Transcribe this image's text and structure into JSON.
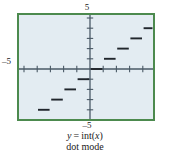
{
  "figure": {
    "caption_line1": "y = int(x)",
    "caption_line2": "dot mode",
    "caption_parts": {
      "var_y": "y",
      "equals": "=",
      "func": "int(",
      "var_x": "x",
      "close": ")"
    }
  },
  "axis_labels": {
    "top": "5",
    "bottom": "–5",
    "left": "–5"
  },
  "colors": {
    "frame": "#4c8a4e",
    "screen_bg": "#e3ecf2",
    "axis": "#4a5a66",
    "curve": "#20262c",
    "text": "#1b1b1b",
    "page_bg": "#ffffff"
  },
  "chart_data": {
    "type": "line",
    "subtitle": "dot mode",
    "xlabel": "",
    "ylabel": "",
    "xlim": [
      -5,
      5
    ],
    "ylim": [
      -5,
      5
    ],
    "xticks": [
      -5,
      -4,
      -3,
      -2,
      -1,
      0,
      1,
      2,
      3,
      4,
      5
    ],
    "yticks": [
      -5,
      -4,
      -3,
      -2,
      -1,
      0,
      1,
      2,
      3,
      4,
      5
    ],
    "grid": false,
    "legend": null,
    "axis_tick_labels": {
      "x_top": "5",
      "x_bottom": "-5",
      "y_left": "-5"
    },
    "note": "Greatest integer (floor) function drawn in dot mode: horizontal segments are disconnected, no vertical jumps.",
    "series": [
      {
        "name": "int(x)",
        "style": "step-segments",
        "segments": [
          {
            "x0": -5,
            "x1": -4,
            "y": -5
          },
          {
            "x0": -4,
            "x1": -3,
            "y": -4
          },
          {
            "x0": -3,
            "x1": -2,
            "y": -3
          },
          {
            "x0": -2,
            "x1": -1,
            "y": -2
          },
          {
            "x0": -1,
            "x1": 0,
            "y": -1
          },
          {
            "x0": 0,
            "x1": 1,
            "y": 0
          },
          {
            "x0": 1,
            "x1": 2,
            "y": 1
          },
          {
            "x0": 2,
            "x1": 3,
            "y": 2
          },
          {
            "x0": 3,
            "x1": 4,
            "y": 3
          },
          {
            "x0": 4,
            "x1": 5,
            "y": 4
          }
        ]
      }
    ]
  }
}
